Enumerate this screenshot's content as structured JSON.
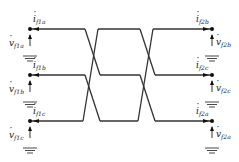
{
  "diagram": {
    "type": "three-phase transposition circuit",
    "stroke_color": "#333333",
    "wire_rows_y": [
      29,
      75,
      121
    ],
    "left_x": 30,
    "right_x": 212,
    "crossings": [
      {
        "x_start": 85,
        "x_end": 100
      },
      {
        "x_start": 140,
        "x_end": 155
      }
    ],
    "left_ports": [
      {
        "current": {
          "base": "i",
          "sub": "f1a"
        },
        "voltage": {
          "base": "v",
          "sub": "f1a"
        }
      },
      {
        "current": {
          "base": "i",
          "sub": "f1b"
        },
        "voltage": {
          "base": "v",
          "sub": "f1b"
        }
      },
      {
        "current": {
          "base": "i",
          "sub": "f1c"
        },
        "voltage": {
          "base": "v",
          "sub": "f1c"
        }
      }
    ],
    "right_ports": [
      {
        "current": {
          "base": "i",
          "sub": "f2b"
        },
        "voltage": {
          "base": "v",
          "sub": "f2b"
        }
      },
      {
        "current": {
          "base": "i",
          "sub": "f2c"
        },
        "voltage": {
          "base": "v",
          "sub": "f2c"
        }
      },
      {
        "current": {
          "base": "i",
          "sub": "f2a"
        },
        "voltage": {
          "base": "v",
          "sub": "f2a"
        }
      }
    ]
  }
}
